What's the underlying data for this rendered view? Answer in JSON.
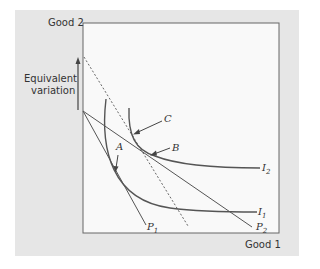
{
  "axes": {
    "y_label": "Good 2",
    "x_label": "Good 1"
  },
  "annotation": {
    "text_line1": "Equivalent",
    "text_line2": "variation"
  },
  "points": {
    "A": "A",
    "B": "B",
    "C": "C"
  },
  "curves": {
    "I1": "I",
    "I1_sub": "1",
    "I2": "I",
    "I2_sub": "2"
  },
  "budget_lines": {
    "P1": "P",
    "P1_sub": "1",
    "P2": "P",
    "P2_sub": "2"
  },
  "colors": {
    "panel": "#e6e6e6",
    "plot_bg": "#f9f9f9",
    "line": "#555555"
  }
}
